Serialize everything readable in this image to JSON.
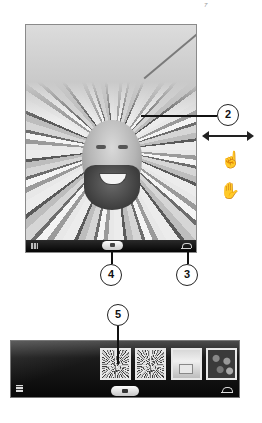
{
  "page": {
    "marker": "7"
  },
  "photo_booth": {
    "preview": {
      "description": "Live camera preview with light-tunnel effect applied",
      "effect": "Light Tunnel"
    },
    "toolbar": {
      "grid_icon": "effects-grid-icon",
      "camera_button_icon": "camera-icon",
      "effects_icon": "effects-toggle-icon"
    }
  },
  "gestures": {
    "swipe": "swipe-horizontal-icon",
    "tap": "tap-icon",
    "double_tap": "double-tap-icon"
  },
  "callouts": [
    {
      "id": "2",
      "label": "2",
      "target": "preview"
    },
    {
      "id": "3",
      "label": "3",
      "target": "effects-button"
    },
    {
      "id": "4",
      "label": "4",
      "target": "camera-button"
    },
    {
      "id": "5",
      "label": "5",
      "target": "first-thumbnail"
    }
  ],
  "thumbnail_strip": {
    "thumbnails": [
      {
        "kind": "tunnel",
        "label": "Photo 1"
      },
      {
        "kind": "tunnel",
        "label": "Photo 2"
      },
      {
        "kind": "room",
        "label": "Photo 3"
      },
      {
        "kind": "crowd",
        "label": "Photo 4"
      }
    ],
    "grid_icon": "effects-grid-icon",
    "camera_button_icon": "camera-icon",
    "effects_icon": "effects-toggle-icon"
  },
  "colors": {
    "toolbar_bg": "#050505",
    "callout_stroke": "#222222",
    "thumb_border": "#e8e8e8"
  }
}
